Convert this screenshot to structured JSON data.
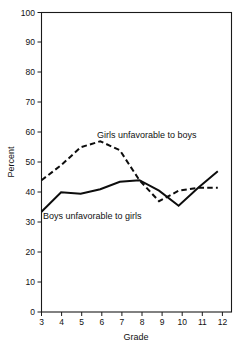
{
  "chart_data": {
    "type": "line",
    "title": "",
    "subtitle": "",
    "xlabel": "Grade",
    "ylabel": "Percent",
    "x": [
      3,
      4,
      5,
      6,
      7,
      8,
      9,
      10,
      11,
      12
    ],
    "xlim": [
      3,
      12.7
    ],
    "ylim": [
      0,
      100
    ],
    "xticks": [
      3,
      4,
      5,
      6,
      7,
      8,
      9,
      10,
      11,
      12
    ],
    "xticklabels": [
      "3",
      "4",
      "5",
      "6",
      "7",
      "8",
      "9",
      "10",
      "11",
      "12"
    ],
    "yticks": [
      0,
      10,
      20,
      30,
      40,
      50,
      60,
      70,
      80,
      90,
      100
    ],
    "yticklabels": [
      "0",
      "10",
      "20",
      "30",
      "40",
      "50",
      "60",
      "70",
      "80",
      "90",
      "100"
    ],
    "grid": false,
    "legend_position": "inline-annotations",
    "series": [
      {
        "name": "Girls unfavorable to boys",
        "style": "dashed",
        "color": "#0d0d0d",
        "values": [
          44,
          49,
          55,
          57,
          54,
          44,
          37,
          40.5,
          41.5,
          41.5
        ]
      },
      {
        "name": "Boys unfavorable to girls",
        "style": "solid",
        "color": "#0d0d0d",
        "values": [
          33.5,
          40,
          39.5,
          41,
          43.5,
          44,
          40.5,
          35.5,
          41.5,
          47
        ]
      }
    ],
    "annotations": [
      {
        "text": "Girls unfavorable to boys",
        "x": 6.25,
        "y": 59.5
      },
      {
        "text": "Boys unfavorable to girls",
        "x": 3.35,
        "y": 32.0
      }
    ]
  },
  "axis": {
    "x_title": "Grade",
    "y_title": "Percent"
  }
}
